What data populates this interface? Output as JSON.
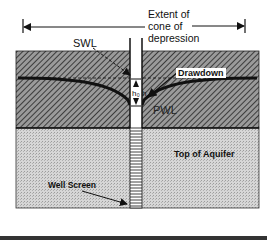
{
  "diagram": {
    "title_lines": [
      "Extent of",
      "cone of",
      "depression"
    ],
    "labels": {
      "swl": "SWL",
      "drawdown": "Drawdown",
      "pwl": "PWL",
      "top_of_aquifer": "Top of Aquifer",
      "well_screen": "Well Screen",
      "hq": "h₀ h"
    },
    "colors": {
      "confining_layer": "#7a7a7a",
      "aquifer": "#cfcfcf",
      "line": "#111111",
      "background": "#ffffff"
    }
  }
}
